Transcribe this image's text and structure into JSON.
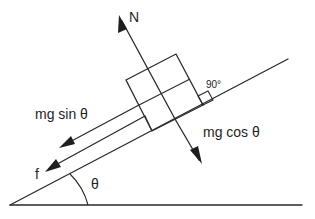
{
  "diagram": {
    "colors": {
      "stroke": "#2a2a2a",
      "background": "#ffffff"
    },
    "labels": {
      "normal_force": "N",
      "parallel_component": "mg sin  θ",
      "perpendicular_component": "mg cos  θ",
      "friction": "f",
      "angle": "θ",
      "right_angle": "90°"
    },
    "elements": [
      {
        "id": "incline",
        "type": "line",
        "description": "inclined plane surface"
      },
      {
        "id": "ground",
        "type": "line",
        "description": "horizontal ground"
      },
      {
        "id": "block",
        "type": "rectangle",
        "description": "block resting on incline"
      },
      {
        "id": "normal-force",
        "type": "arrow",
        "label": "N",
        "direction": "perpendicular to incline, away from surface"
      },
      {
        "id": "mg-cos-theta",
        "type": "arrow",
        "label": "mg cos θ",
        "direction": "perpendicular into incline"
      },
      {
        "id": "mg-sin-theta",
        "type": "arrow",
        "label": "mg sin θ",
        "direction": "down the incline"
      },
      {
        "id": "friction",
        "type": "arrow",
        "label": "f",
        "direction": "down the incline"
      },
      {
        "id": "angle-arc",
        "type": "arc",
        "label": "θ"
      },
      {
        "id": "right-angle-marker",
        "type": "square",
        "label": "90°"
      }
    ]
  }
}
